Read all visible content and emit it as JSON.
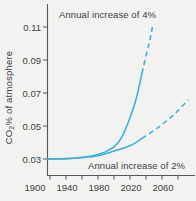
{
  "figure": {
    "background": "#f2f3f1",
    "curve_color": "#41b0d5",
    "axis_color": "#56575b",
    "text_color": "#414042"
  },
  "labels": {
    "annotation_4pct": "Annual increase of 4%",
    "annotation_2pct": "Annual increase of 2%",
    "y_axis_prefix": "CO",
    "y_axis_sub": "2",
    "y_axis_suffix": "% of atmosphere"
  },
  "chart_data": {
    "type": "line",
    "title": "",
    "xlabel": "Year",
    "ylabel": "CO2% of atmosphere",
    "xlim": [
      1900,
      2100
    ],
    "ylim": [
      0.02,
      0.12
    ],
    "x_ticks_labeled": [
      1900,
      1940,
      1980,
      2020,
      2060
    ],
    "x_ticks_minor": [
      1920,
      1940,
      1960,
      1980,
      2000,
      2020,
      2040,
      2060,
      2080
    ],
    "y_ticks": [
      0.03,
      0.05,
      0.07,
      0.09,
      0.11
    ],
    "grid": false,
    "legend": "annotations on plot",
    "line_style_note": "both curves solid until ~2035, dashed (projection) afterwards",
    "series": [
      {
        "name": "Annual increase of 4%",
        "dashed_from": 2035,
        "points": [
          [
            1917,
            0.03
          ],
          [
            1950,
            0.0305
          ],
          [
            1980,
            0.0327
          ],
          [
            2000,
            0.0373
          ],
          [
            2010,
            0.0435
          ],
          [
            2020,
            0.055
          ],
          [
            2028,
            0.067
          ],
          [
            2035,
            0.082
          ],
          [
            2041,
            0.0945
          ],
          [
            2045,
            0.1025
          ],
          [
            2048,
            0.11
          ]
        ]
      },
      {
        "name": "Annual increase of 2%",
        "dashed_from": 2035,
        "points": [
          [
            1917,
            0.03
          ],
          [
            1940,
            0.0302
          ],
          [
            1960,
            0.0308
          ],
          [
            1980,
            0.032
          ],
          [
            2000,
            0.0348
          ],
          [
            2020,
            0.038
          ],
          [
            2035,
            0.0425
          ],
          [
            2055,
            0.049
          ],
          [
            2075,
            0.057
          ],
          [
            2093,
            0.066
          ]
        ]
      }
    ]
  }
}
